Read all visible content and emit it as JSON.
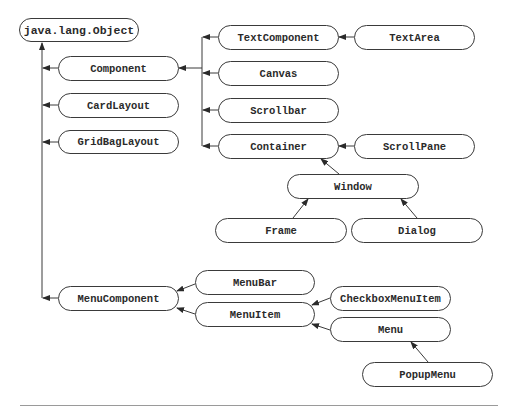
{
  "diagram": {
    "colors": {
      "line": "#3a3a3a",
      "text": "#2a2a2a",
      "background": "#ffffff",
      "rule": "#9a9a9a"
    },
    "nodes": {
      "object": "java.lang.Object",
      "component": "Component",
      "cardlayout": "CardLayout",
      "gridbaglayout": "GridBagLayout",
      "textcomponent": "TextComponent",
      "textarea": "TextArea",
      "canvas": "Canvas",
      "scrollbar": "Scrollbar",
      "container": "Container",
      "scrollpane": "ScrollPane",
      "window": "Window",
      "frame": "Frame",
      "dialog": "Dialog",
      "menucomponent": "MenuComponent",
      "menubar": "MenuBar",
      "menuitem": "MenuItem",
      "checkboxmenuitem": "CheckboxMenuItem",
      "menu": "Menu",
      "popupmenu": "PopupMenu"
    },
    "edges": [
      {
        "from": "Component",
        "to": "java.lang.Object"
      },
      {
        "from": "CardLayout",
        "to": "java.lang.Object"
      },
      {
        "from": "GridBagLayout",
        "to": "java.lang.Object"
      },
      {
        "from": "MenuComponent",
        "to": "java.lang.Object"
      },
      {
        "from": "TextComponent",
        "to": "Component"
      },
      {
        "from": "Canvas",
        "to": "Component"
      },
      {
        "from": "Scrollbar",
        "to": "Component"
      },
      {
        "from": "Container",
        "to": "Component"
      },
      {
        "from": "TextArea",
        "to": "TextComponent"
      },
      {
        "from": "ScrollPane",
        "to": "Container"
      },
      {
        "from": "Window",
        "to": "Container"
      },
      {
        "from": "Frame",
        "to": "Window"
      },
      {
        "from": "Dialog",
        "to": "Window"
      },
      {
        "from": "MenuBar",
        "to": "MenuComponent"
      },
      {
        "from": "MenuItem",
        "to": "MenuComponent"
      },
      {
        "from": "CheckboxMenuItem",
        "to": "MenuItem"
      },
      {
        "from": "Menu",
        "to": "MenuItem"
      },
      {
        "from": "PopupMenu",
        "to": "Menu"
      }
    ]
  }
}
